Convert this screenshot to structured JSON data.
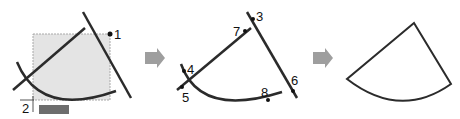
{
  "panels": [
    {
      "id": "step1",
      "labels": {
        "p1": "1",
        "p2": "2"
      }
    },
    {
      "id": "step2",
      "labels": {
        "p3": "3",
        "p4": "4",
        "p5": "5",
        "p6": "6",
        "p7": "7",
        "p8": "8"
      }
    },
    {
      "id": "step3",
      "labels": {}
    }
  ],
  "colors": {
    "stroke": "#2b2b2b",
    "selection_fill": "#e4e4e4",
    "selection_border": "#a8a8a8",
    "arrow": "#9e9e9e",
    "tooltip": "#6d6d6d"
  }
}
